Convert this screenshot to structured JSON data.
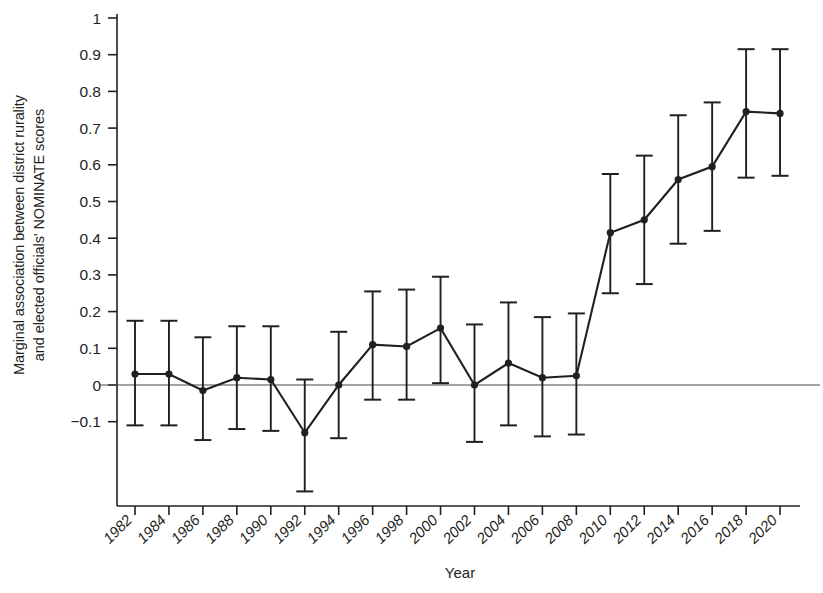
{
  "chart_data": {
    "type": "line",
    "title": "",
    "xlabel": "Year",
    "ylabel_line1": "Marginal association between district rurality",
    "ylabel_line2": "and elected officials' NOMINATE scores",
    "categories": [
      "1982",
      "1984",
      "1986",
      "1988",
      "1990",
      "1992",
      "1994",
      "1996",
      "1998",
      "2000",
      "2002",
      "2004",
      "2006",
      "2008",
      "2010",
      "2012",
      "2014",
      "2016",
      "2018",
      "2020"
    ],
    "values": [
      0.03,
      0.03,
      -0.015,
      0.02,
      0.015,
      -0.13,
      0.0,
      0.11,
      0.105,
      0.155,
      0.0,
      0.06,
      0.02,
      0.025,
      0.415,
      0.45,
      0.56,
      0.595,
      0.745,
      0.74
    ],
    "ci_lower": [
      -0.11,
      -0.11,
      -0.15,
      -0.12,
      -0.125,
      -0.29,
      -0.145,
      -0.04,
      -0.04,
      0.005,
      -0.155,
      -0.11,
      -0.14,
      -0.135,
      0.25,
      0.275,
      0.385,
      0.42,
      0.565,
      0.57
    ],
    "ci_upper": [
      0.175,
      0.175,
      0.13,
      0.16,
      0.16,
      0.015,
      0.145,
      0.255,
      0.26,
      0.295,
      0.165,
      0.225,
      0.185,
      0.195,
      0.575,
      0.625,
      0.735,
      0.77,
      0.915,
      0.915
    ],
    "ytick_labels": [
      "1",
      "0.9",
      "0.8",
      "0.7",
      "0.6",
      "0.5",
      "0.4",
      "0.3",
      "0.2",
      "0.1",
      "0",
      "−0.1"
    ],
    "ytick_values": [
      1,
      0.9,
      0.8,
      0.7,
      0.6,
      0.5,
      0.4,
      0.3,
      0.2,
      0.1,
      0,
      -0.1
    ],
    "ylim": [
      -0.32,
      1.0
    ],
    "grid": false,
    "legend": "none",
    "series_name": "Marginal association",
    "zero_reference_line": 0,
    "marker": "filled-circle",
    "errorbar_style": "capped",
    "line_color": "#231f20",
    "marker_color": "#231f20",
    "axis_color": "#231f20",
    "background_color": "#ffffff"
  }
}
